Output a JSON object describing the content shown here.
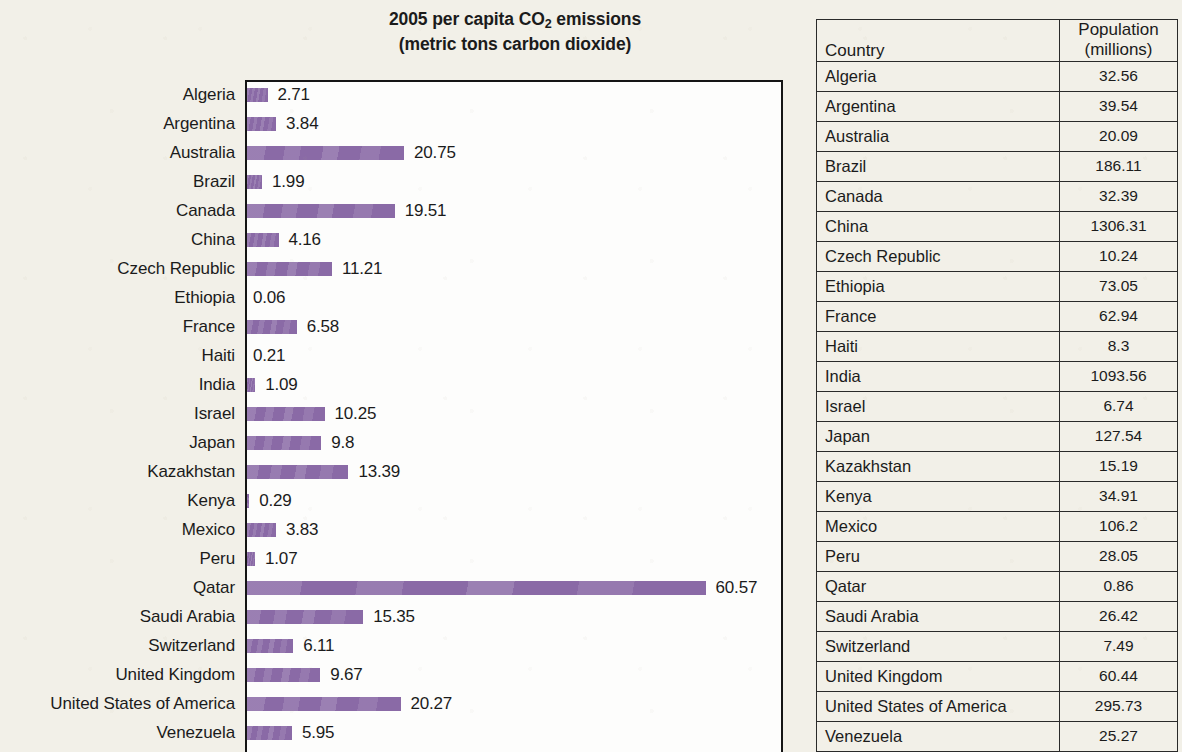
{
  "chart": {
    "title_line1_prefix": "2005 per capita CO",
    "title_line1_sub": "2",
    "title_line1_suffix": " emissions",
    "title_line2": "(metric tons carbon dioxide)",
    "bar_color": "#8a6aa6",
    "frame_color": "#151515",
    "plot_background": "#fdfdfc"
  },
  "table": {
    "header": {
      "country": "Country",
      "population_line1": "Population",
      "population_line2": "(millions)"
    }
  },
  "page": {
    "background": "#f2f0e8"
  },
  "chart_data": {
    "type": "bar",
    "orientation": "horizontal",
    "title": "2005 per capita CO2 emissions (metric tons carbon dioxide)",
    "xlabel": "",
    "ylabel": "",
    "xlim": [
      0,
      70.8
    ],
    "grid": false,
    "legend": null,
    "data_labels": true,
    "categories": [
      "Algeria",
      "Argentina",
      "Australia",
      "Brazil",
      "Canada",
      "China",
      "Czech Republic",
      "Ethiopia",
      "France",
      "Haiti",
      "India",
      "Israel",
      "Japan",
      "Kazakhstan",
      "Kenya",
      "Mexico",
      "Peru",
      "Qatar",
      "Saudi Arabia",
      "Switzerland",
      "United Kingdom",
      "United States of America",
      "Venezuela"
    ],
    "values": [
      2.71,
      3.84,
      20.75,
      1.99,
      19.51,
      4.16,
      11.21,
      0.06,
      6.58,
      0.21,
      1.09,
      10.25,
      9.8,
      13.39,
      0.29,
      3.83,
      1.07,
      60.57,
      15.35,
      6.11,
      9.67,
      20.27,
      5.95
    ],
    "value_labels": [
      "2.71",
      "3.84",
      "20.75",
      "1.99",
      "19.51",
      "4.16",
      "11.21",
      "0.06",
      "6.58",
      "0.21",
      "1.09",
      "10.25",
      "9.8",
      "13.39",
      "0.29",
      "3.83",
      "1.07",
      "60.57",
      "15.35",
      "6.11",
      "9.67",
      "20.27",
      "5.95"
    ],
    "companion_table": {
      "type": "table",
      "columns": [
        "Country",
        "Population (millions)"
      ],
      "rows": [
        [
          "Algeria",
          "32.56"
        ],
        [
          "Argentina",
          "39.54"
        ],
        [
          "Australia",
          "20.09"
        ],
        [
          "Brazil",
          "186.11"
        ],
        [
          "Canada",
          "32.39"
        ],
        [
          "China",
          "1306.31"
        ],
        [
          "Czech Republic",
          "10.24"
        ],
        [
          "Ethiopia",
          "73.05"
        ],
        [
          "France",
          "62.94"
        ],
        [
          "Haiti",
          "8.3"
        ],
        [
          "India",
          "1093.56"
        ],
        [
          "Israel",
          "6.74"
        ],
        [
          "Japan",
          "127.54"
        ],
        [
          "Kazakhstan",
          "15.19"
        ],
        [
          "Kenya",
          "34.91"
        ],
        [
          "Mexico",
          "106.2"
        ],
        [
          "Peru",
          "28.05"
        ],
        [
          "Qatar",
          "0.86"
        ],
        [
          "Saudi Arabia",
          "26.42"
        ],
        [
          "Switzerland",
          "7.49"
        ],
        [
          "United Kingdom",
          "60.44"
        ],
        [
          "United States of America",
          "295.73"
        ],
        [
          "Venezuela",
          "25.27"
        ]
      ]
    }
  }
}
